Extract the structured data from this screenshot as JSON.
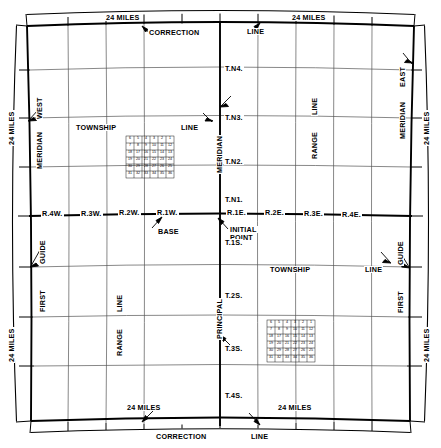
{
  "diagram": {
    "edge_dimensions": {
      "top_left": "24 MILES",
      "top_right": "24 MILES",
      "bottom_left": "24 MILES",
      "bottom_right": "24 MILES",
      "left_upper": "24 MILES",
      "left_lower": "24 MILES",
      "right_upper": "24 MILES",
      "right_lower": "24 MILES"
    },
    "top_labels": {
      "correction": "CORRECTION",
      "line": "LINE"
    },
    "bottom_labels": {
      "correction": "CORRECTION",
      "line": "LINE"
    },
    "left_labels": {
      "meridian": "MERIDIAN",
      "west": "WEST",
      "first": "FIRST",
      "guide": "GUIDE"
    },
    "right_labels": {
      "meridian": "MERIDIAN",
      "east": "EAST",
      "first": "FIRST",
      "guide": "GUIDE"
    },
    "center_labels": {
      "meridian": "MERIDIAN",
      "principal": "PRINCIPAL",
      "base": "BASE",
      "initial_point_1": "INITIAL",
      "initial_point_2": "POINT"
    },
    "interior_labels": {
      "township_nw": "TOWNSHIP",
      "line_nw": "LINE",
      "township_se": "TOWNSHIP",
      "line_se": "LINE",
      "range_ne": "RANGE",
      "line_ne": "LINE",
      "range_sw": "RANGE",
      "line_sw": "LINE"
    },
    "townships_north": [
      "T.N4.",
      "T.N3.",
      "T.N2.",
      "T.N1."
    ],
    "townships_south": [
      "T.1S.",
      "T.2S.",
      "T.3S.",
      "T.4S."
    ],
    "ranges_west": [
      "R.4W.",
      "R.3W.",
      "R.2W.",
      "R.1W."
    ],
    "ranges_east": [
      "R.1E.",
      "R.2E.",
      "R.3E.",
      "R.4E."
    ],
    "section_grid_nw": {
      "caption": "township sections",
      "rows": [
        [
          6,
          5,
          4,
          3,
          2,
          1
        ],
        [
          7,
          8,
          9,
          10,
          11,
          12
        ],
        [
          18,
          17,
          16,
          15,
          14,
          13
        ],
        [
          19,
          20,
          21,
          22,
          23,
          24
        ],
        [
          30,
          29,
          28,
          27,
          26,
          25
        ],
        [
          31,
          32,
          33,
          34,
          35,
          36
        ]
      ]
    },
    "section_grid_se": {
      "caption": "township sections",
      "rows": [
        [
          6,
          5,
          4,
          3,
          2,
          1
        ],
        [
          7,
          8,
          9,
          10,
          11,
          12
        ],
        [
          18,
          17,
          16,
          15,
          14,
          13
        ],
        [
          19,
          20,
          21,
          22,
          23,
          24
        ],
        [
          30,
          29,
          28,
          27,
          26,
          25
        ],
        [
          31,
          32,
          33,
          34,
          35,
          36
        ]
      ]
    },
    "colors": {
      "ink": "#000000",
      "grid": "#555555",
      "background": "#ffffff"
    }
  }
}
